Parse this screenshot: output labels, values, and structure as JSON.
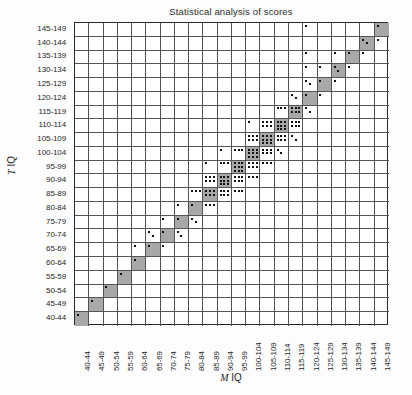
{
  "chart_data": {
    "type": "heatmap",
    "title": "Statistical analysis of scores",
    "xlabel": "M IQ",
    "ylabel": "T IQ",
    "grid": true,
    "legend": "none",
    "x_axis_title_italic": "M",
    "x_axis_title_rest": " IQ",
    "y_axis_title_italic": "T",
    "y_axis_title_rest": " IQ",
    "categories": [
      "40-44",
      "45-49",
      "50-54",
      "55-59",
      "60-64",
      "65-69",
      "70-74",
      "75-79",
      "80-84",
      "85-89",
      "90-94",
      "95-99",
      "100-104",
      "105-109",
      "110-114",
      "115-119",
      "120-124",
      "125-129",
      "130-134",
      "135-139",
      "140-144",
      "145-149"
    ],
    "y_categories_top_to_bottom": [
      "145-149",
      "140-144",
      "135-139",
      "130-134",
      "125-129",
      "120-124",
      "115-119",
      "110-114",
      "105-109",
      "100-104",
      "95-99",
      "90-94",
      "85-89",
      "80-84",
      "75-79",
      "70-74",
      "65-69",
      "60-64",
      "55-59",
      "50-54",
      "45-49",
      "40-44"
    ],
    "cell_shading_note": "Diagonal cells (M IQ band equals T IQ band) are filled grey.",
    "counts_note": "Each small black dot inside a cell represents one observation; empty cells have zero observations.",
    "counts": [
      {
        "x": "40-44",
        "y": "40-44",
        "n": 1
      },
      {
        "x": "45-49",
        "y": "45-49",
        "n": 1
      },
      {
        "x": "50-54",
        "y": "50-54",
        "n": 1
      },
      {
        "x": "55-59",
        "y": "55-59",
        "n": 1
      },
      {
        "x": "60-64",
        "y": "60-64",
        "n": 1
      },
      {
        "x": "60-64",
        "y": "65-69",
        "n": 1
      },
      {
        "x": "65-69",
        "y": "65-69",
        "n": 1
      },
      {
        "x": "65-69",
        "y": "70-74",
        "n": 2
      },
      {
        "x": "70-74",
        "y": "65-69",
        "n": 1
      },
      {
        "x": "70-74",
        "y": "70-74",
        "n": 1
      },
      {
        "x": "70-74",
        "y": "75-79",
        "n": 1
      },
      {
        "x": "75-79",
        "y": "70-74",
        "n": 2
      },
      {
        "x": "75-79",
        "y": "75-79",
        "n": 1
      },
      {
        "x": "75-79",
        "y": "80-84",
        "n": 1
      },
      {
        "x": "80-84",
        "y": "75-79",
        "n": 2
      },
      {
        "x": "80-84",
        "y": "80-84",
        "n": 1
      },
      {
        "x": "80-84",
        "y": "85-89",
        "n": 3
      },
      {
        "x": "85-89",
        "y": "80-84",
        "n": 3
      },
      {
        "x": "85-89",
        "y": "85-89",
        "n": 6
      },
      {
        "x": "85-89",
        "y": "90-94",
        "n": 6
      },
      {
        "x": "85-89",
        "y": "95-99",
        "n": 1
      },
      {
        "x": "90-94",
        "y": "85-89",
        "n": 6
      },
      {
        "x": "90-94",
        "y": "90-94",
        "n": 9
      },
      {
        "x": "90-94",
        "y": "95-99",
        "n": 3
      },
      {
        "x": "90-94",
        "y": "100-104",
        "n": 1
      },
      {
        "x": "95-99",
        "y": "85-89",
        "n": 3
      },
      {
        "x": "95-99",
        "y": "90-94",
        "n": 6
      },
      {
        "x": "95-99",
        "y": "95-99",
        "n": 9
      },
      {
        "x": "95-99",
        "y": "100-104",
        "n": 3
      },
      {
        "x": "100-104",
        "y": "90-94",
        "n": 3
      },
      {
        "x": "100-104",
        "y": "95-99",
        "n": 6
      },
      {
        "x": "100-104",
        "y": "100-104",
        "n": 9
      },
      {
        "x": "100-104",
        "y": "105-109",
        "n": 6
      },
      {
        "x": "100-104",
        "y": "110-114",
        "n": 1
      },
      {
        "x": "105-109",
        "y": "95-99",
        "n": 3
      },
      {
        "x": "105-109",
        "y": "100-104",
        "n": 6
      },
      {
        "x": "105-109",
        "y": "105-109",
        "n": 9
      },
      {
        "x": "105-109",
        "y": "110-114",
        "n": 6
      },
      {
        "x": "110-114",
        "y": "100-104",
        "n": 2
      },
      {
        "x": "110-114",
        "y": "105-109",
        "n": 6
      },
      {
        "x": "110-114",
        "y": "110-114",
        "n": 9
      },
      {
        "x": "110-114",
        "y": "115-119",
        "n": 3
      },
      {
        "x": "115-119",
        "y": "105-109",
        "n": 2
      },
      {
        "x": "115-119",
        "y": "110-114",
        "n": 6
      },
      {
        "x": "115-119",
        "y": "115-119",
        "n": 6
      },
      {
        "x": "115-119",
        "y": "120-124",
        "n": 2
      },
      {
        "x": "120-124",
        "y": "115-119",
        "n": 2
      },
      {
        "x": "120-124",
        "y": "120-124",
        "n": 1
      },
      {
        "x": "120-124",
        "y": "125-129",
        "n": 2
      },
      {
        "x": "120-124",
        "y": "130-134",
        "n": 1
      },
      {
        "x": "120-124",
        "y": "135-139",
        "n": 1
      },
      {
        "x": "120-124",
        "y": "145-149",
        "n": 1
      },
      {
        "x": "125-129",
        "y": "120-124",
        "n": 1
      },
      {
        "x": "125-129",
        "y": "125-129",
        "n": 1
      },
      {
        "x": "125-129",
        "y": "130-134",
        "n": 1
      },
      {
        "x": "130-134",
        "y": "125-129",
        "n": 1
      },
      {
        "x": "130-134",
        "y": "130-134",
        "n": 2
      },
      {
        "x": "130-134",
        "y": "135-139",
        "n": 1
      },
      {
        "x": "135-139",
        "y": "130-134",
        "n": 1
      },
      {
        "x": "135-139",
        "y": "135-139",
        "n": 1
      },
      {
        "x": "140-144",
        "y": "135-139",
        "n": 1
      },
      {
        "x": "140-144",
        "y": "140-144",
        "n": 2
      },
      {
        "x": "145-149",
        "y": "140-144",
        "n": 1
      },
      {
        "x": "145-149",
        "y": "145-149",
        "n": 1
      }
    ]
  }
}
